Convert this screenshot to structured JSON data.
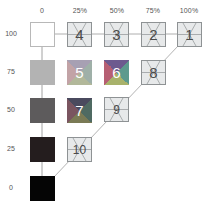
{
  "columns": [
    "0",
    "25%",
    "50%",
    "75%",
    "100%"
  ],
  "rows": [
    "100",
    "75",
    "50",
    "25",
    "0"
  ],
  "gray_scale": [
    {
      "row": "100",
      "color": "#ffffff"
    },
    {
      "row": "75",
      "color": "#b3b3b3"
    },
    {
      "row": "50",
      "color": "#5d5b5c"
    },
    {
      "row": "25",
      "color": "#241d1e"
    },
    {
      "row": "0",
      "color": "#050505"
    }
  ],
  "outlined_cells": [
    {
      "label": "4",
      "col": "25%",
      "row": "100"
    },
    {
      "label": "3",
      "col": "50%",
      "row": "100"
    },
    {
      "label": "2",
      "col": "75%",
      "row": "100"
    },
    {
      "label": "1",
      "col": "100%",
      "row": "100"
    },
    {
      "label": "8",
      "col": "75%",
      "row": "75"
    },
    {
      "label": "9",
      "col": "50%",
      "row": "50"
    },
    {
      "label": "10",
      "col": "25%",
      "row": "25"
    }
  ],
  "color_cells": [
    {
      "label": "5",
      "col": "25%",
      "row": "75",
      "colors": {
        "tl": "#a7a0b3",
        "tr": "#9fb0a8",
        "bl": "#c2a3a6",
        "br": "#b2b89a"
      }
    },
    {
      "label": "6",
      "col": "50%",
      "row": "75",
      "colors": {
        "tl": "#6d5a8f",
        "tr": "#5d9a8e",
        "bl": "#b65f73",
        "br": "#a8b26b"
      }
    },
    {
      "label": "7",
      "col": "25%",
      "row": "50",
      "colors": {
        "tl": "#4a4a5e",
        "tr": "#4f6a62",
        "bl": "#7a5560",
        "br": "#7a7a55"
      }
    }
  ],
  "colors": {
    "line": "#9a9a9a",
    "outline_fill": "#e7e9ea",
    "outline_stroke": "#8e9294",
    "label_text": "#555555"
  }
}
